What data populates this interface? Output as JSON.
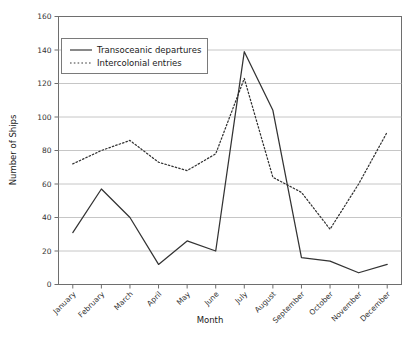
{
  "chart_data": {
    "type": "line",
    "title": "",
    "xlabel": "Month",
    "ylabel": "Number of Ships",
    "categories": [
      "January",
      "February",
      "March",
      "April",
      "May",
      "June",
      "July",
      "August",
      "September",
      "October",
      "November",
      "December"
    ],
    "ylim": [
      0,
      160
    ],
    "ytick_step": 20,
    "yticks": [
      0,
      20,
      40,
      60,
      80,
      100,
      120,
      140,
      160
    ],
    "grid": true,
    "legend_position": "top-left-inside",
    "series": [
      {
        "name": "Transoceanic departures",
        "style": "solid",
        "color": "#333333",
        "values": [
          31,
          57,
          40,
          12,
          26,
          20,
          139,
          104,
          16,
          14,
          7,
          12
        ]
      },
      {
        "name": "Intercolonial entries",
        "style": "dotted",
        "color": "#333333",
        "values": [
          72,
          80,
          86,
          73,
          68,
          78,
          123,
          64,
          55,
          33,
          60,
          91
        ]
      }
    ]
  },
  "axis": {
    "y_title": "Number of Ships",
    "x_title": "Month"
  },
  "legend": {
    "items": [
      {
        "label": "Transoceanic departures",
        "marker": "solid-line-swatch"
      },
      {
        "label": "Intercolonial entries",
        "marker": "dotted-line-swatch"
      }
    ]
  },
  "colors": {
    "plot_border": "#6e6e6e",
    "gridline": "#b8b8b8",
    "series_line": "#3a3a3a",
    "background": "#ffffff",
    "text": "#1a1a1a"
  }
}
